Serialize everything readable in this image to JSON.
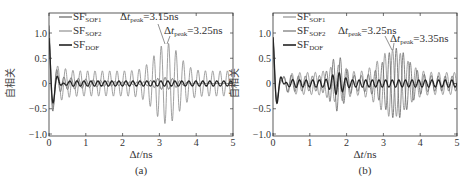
{
  "chart_data": [
    {
      "type": "line",
      "panel_label": "(a)",
      "xlabel": "Δt/ns",
      "ylabel": "自相关",
      "xlim": [
        0,
        5
      ],
      "ylim": [
        -1.0,
        1.3
      ],
      "xticks": [
        "0",
        "1",
        "2",
        "3",
        "4",
        "5"
      ],
      "yticks": [
        "1.0",
        "0.5",
        "0",
        "-0.5",
        "-1.0"
      ],
      "grid": false,
      "legend_position": "upper-left",
      "series": [
        {
          "name": "SF_SOF1",
          "label_main": "SF",
          "label_sub": "SOF1",
          "color": "#555555",
          "description": "decaying oscillation, peak envelope near 3.15ns ~0.75"
        },
        {
          "name": "SF_SOF2",
          "label_main": "SF",
          "label_sub": "SOF2",
          "color": "#888888",
          "description": "decaying oscillation, revival near 3.25ns ~0.8"
        },
        {
          "name": "SF_DOF",
          "label_main": "SF",
          "label_sub": "DOF",
          "color": "#222222",
          "description": "rapid decay, stays near 0 after 0.5ns"
        }
      ],
      "annotations": [
        {
          "text_main": "Δt",
          "text_sub": "peak",
          "text_val": "=3.15ns",
          "x": 3.15,
          "y": 0.75
        },
        {
          "text_main": "Δt",
          "text_sub": "peak",
          "text_val": "=3.25ns",
          "x": 3.25,
          "y": 0.78
        }
      ]
    },
    {
      "type": "line",
      "panel_label": "(b)",
      "xlabel": "Δt/ns",
      "ylabel": "自相关",
      "xlim": [
        0,
        5
      ],
      "ylim": [
        -1.0,
        1.3
      ],
      "xticks": [
        "0",
        "1",
        "2",
        "3",
        "4",
        "5"
      ],
      "yticks": [
        "1.0",
        "0.5",
        "0",
        "-0.5",
        "-1.0"
      ],
      "grid": false,
      "legend_position": "upper-left",
      "series": [
        {
          "name": "SF_SOF1",
          "label_main": "SF",
          "label_sub": "SOF1",
          "color": "#888888",
          "description": "decaying oscillation, revival near 3.25ns ~0.7"
        },
        {
          "name": "SF_SOF2",
          "label_main": "SF",
          "label_sub": "SOF2",
          "color": "#666666",
          "description": "decaying oscillation with revivals near 1.7ns and 3.35ns ~0.75"
        },
        {
          "name": "SF_DOF",
          "label_main": "SF",
          "label_sub": "DOF",
          "color": "#222222",
          "description": "rapid decay, small oscillation near 0"
        }
      ],
      "annotations": [
        {
          "text_main": "Δt",
          "text_sub": "peak",
          "text_val": "=3.25ns",
          "x": 3.25,
          "y": 0.7
        },
        {
          "text_main": "Δt",
          "text_sub": "peak",
          "text_val": "=3.35ns",
          "x": 3.35,
          "y": 0.75
        }
      ]
    }
  ]
}
